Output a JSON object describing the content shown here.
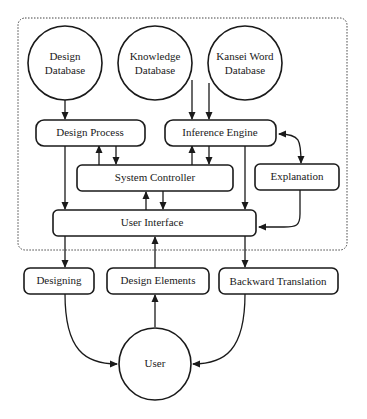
{
  "diagram": {
    "type": "system-architecture",
    "nodes": {
      "design_database": {
        "label_line1": "Design",
        "label_line2": "Database",
        "shape": "circle"
      },
      "knowledge_database": {
        "label_line1": "Knowledge",
        "label_line2": "Database",
        "shape": "circle"
      },
      "kansei_word_database": {
        "label_line1": "Kansei Word",
        "label_line2": "Database",
        "shape": "circle"
      },
      "design_process": {
        "label": "Design Process",
        "shape": "rounded-rect"
      },
      "inference_engine": {
        "label": "Inference Engine",
        "shape": "rounded-rect"
      },
      "system_controller": {
        "label": "System Controller",
        "shape": "rounded-rect"
      },
      "explanation": {
        "label": "Explanation",
        "shape": "rounded-rect"
      },
      "user_interface": {
        "label": "User Interface",
        "shape": "rounded-rect"
      },
      "designing": {
        "label": "Designing",
        "shape": "rounded-rect"
      },
      "design_elements": {
        "label": "Design Elements",
        "shape": "rounded-rect"
      },
      "backward_translation": {
        "label": "Backward Translation",
        "shape": "rounded-rect"
      },
      "user": {
        "label": "User",
        "shape": "circle"
      }
    },
    "edges": [
      {
        "from": "Design Database",
        "to": "Design Process"
      },
      {
        "from": "Knowledge Database",
        "to": "Inference Engine"
      },
      {
        "from": "Kansei Word Database",
        "to": "Inference Engine"
      },
      {
        "from": "System Controller",
        "to": "Design Process"
      },
      {
        "from": "Design Process",
        "to": "System Controller"
      },
      {
        "from": "System Controller",
        "to": "Inference Engine"
      },
      {
        "from": "Inference Engine",
        "to": "System Controller"
      },
      {
        "from": "Inference Engine",
        "to": "Explanation",
        "bidirectional": true
      },
      {
        "from": "Design Process",
        "to": "User Interface"
      },
      {
        "from": "Inference Engine",
        "to": "User Interface"
      },
      {
        "from": "User Interface",
        "to": "System Controller"
      },
      {
        "from": "System Controller",
        "to": "User Interface"
      },
      {
        "from": "Explanation",
        "to": "User Interface"
      },
      {
        "from": "User Interface",
        "to": "Designing"
      },
      {
        "from": "Design Elements",
        "to": "User Interface"
      },
      {
        "from": "User Interface",
        "to": "Backward Translation"
      },
      {
        "from": "Designing",
        "to": "User"
      },
      {
        "from": "User",
        "to": "Design Elements"
      },
      {
        "from": "Backward Translation",
        "to": "User"
      }
    ],
    "colors": {
      "stroke": "#1a1a1a",
      "background": "#ffffff",
      "frame": "#444444"
    }
  }
}
